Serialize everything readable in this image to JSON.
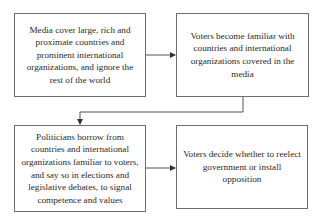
{
  "diagram": {
    "type": "flowchart",
    "nodes": [
      {
        "id": "media",
        "label": "Media cover large, rich and proximate countries and prominent international organizations, and ignore the rest of the world"
      },
      {
        "id": "voters_familiar",
        "label": "Voters become familiar with countries and international organizations covered in the media"
      },
      {
        "id": "politicians",
        "label": "Politicians borrow from countries and international organizations familiar to voters, and say so in elections and legislative debates, to signal competence and values"
      },
      {
        "id": "voters_decide",
        "label": "Voters decide whether to reelect government or install opposition"
      }
    ],
    "edges": [
      {
        "from": "media",
        "to": "voters_familiar"
      },
      {
        "from": "voters_familiar",
        "to": "politicians"
      },
      {
        "from": "politicians",
        "to": "voters_decide"
      }
    ],
    "colors": {
      "border": "#6e6e6e",
      "text": "#2a2a2a",
      "background": "#ffffff",
      "arrow": "#444444"
    }
  }
}
